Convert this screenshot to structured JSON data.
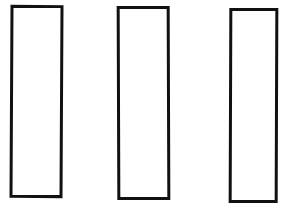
{
  "diagram": {
    "stroke_color": "#111111",
    "background": "#ffffff",
    "shapes": [
      {
        "type": "rectangle",
        "x": 10,
        "y": 5,
        "width": 53,
        "height": 193
      },
      {
        "type": "rectangle",
        "x": 117,
        "y": 6,
        "width": 53,
        "height": 194
      },
      {
        "type": "rectangle",
        "x": 229,
        "y": 8,
        "width": 49,
        "height": 195
      }
    ]
  }
}
